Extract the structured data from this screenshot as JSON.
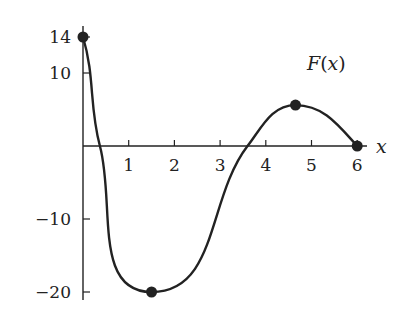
{
  "chart_data": {
    "type": "line",
    "title": "",
    "xlabel": "x",
    "ylabel": "",
    "curve_label": {
      "name": "F",
      "arg": "x"
    },
    "xlim": [
      0,
      6.3
    ],
    "ylim": [
      -21,
      15
    ],
    "x_ticks": [
      1,
      2,
      3,
      4,
      5,
      6
    ],
    "x_tick_labels": [
      "1",
      "2",
      "3",
      "4",
      "5",
      "6"
    ],
    "y_ticks": [
      14,
      10,
      -10,
      -20
    ],
    "y_tick_labels": [
      "14",
      "10",
      "−10",
      "−20"
    ],
    "grid": false,
    "legend": "none",
    "series": [
      {
        "name": "F(x)",
        "x": [
          0,
          0.37,
          1.5,
          3.6,
          4.65,
          6
        ],
        "y": [
          14,
          0,
          -20,
          0,
          5.6,
          0
        ]
      }
    ],
    "marked_points": [
      {
        "x": 0,
        "y": 14
      },
      {
        "x": 1.5,
        "y": -20
      },
      {
        "x": 4.65,
        "y": 5.6
      },
      {
        "x": 6,
        "y": 0
      }
    ],
    "color": "#222222"
  }
}
